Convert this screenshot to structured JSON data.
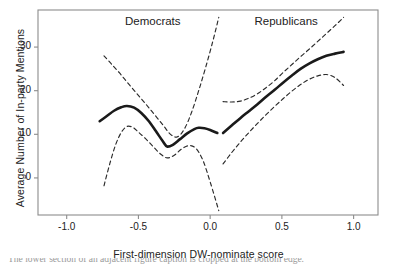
{
  "chart_data": {
    "type": "line",
    "title": "",
    "xlabel": "First-dimension DW-nominate score",
    "ylabel": "Average Number of In-party Mentions",
    "xlim": [
      -1.2,
      1.17
    ],
    "ylim": [
      -8.5,
      38.5
    ],
    "xticks": [
      -1.0,
      -0.5,
      0.0,
      0.5,
      1.0
    ],
    "xticklabels": [
      "-1.0",
      "-0.5",
      "0.0",
      "0.5",
      "1.0"
    ],
    "yticks": [
      0,
      10,
      20,
      30
    ],
    "yticklabels": [
      "0",
      "10",
      "20",
      "30"
    ],
    "grid": false,
    "legend": "none",
    "annotations": [
      {
        "text": "Democrats",
        "x": -0.4,
        "y": 35.5
      },
      {
        "text": "Republicans",
        "x": 0.53,
        "y": 35.5
      }
    ],
    "series": [
      {
        "name": "Democrats fit",
        "style": "solid",
        "color": "#1a1a1a",
        "x": [
          -0.77,
          -0.72,
          -0.67,
          -0.62,
          -0.58,
          -0.53,
          -0.48,
          -0.43,
          -0.38,
          -0.33,
          -0.3,
          -0.26,
          -0.21,
          -0.16,
          -0.11,
          -0.08,
          -0.04,
          0.0,
          0.05
        ],
        "y": [
          13.0,
          14.2,
          15.4,
          16.2,
          16.5,
          16.1,
          14.9,
          13.1,
          10.8,
          8.4,
          7.2,
          7.6,
          8.9,
          10.2,
          11.2,
          11.5,
          11.4,
          11.0,
          10.3
        ]
      },
      {
        "name": "Democrats upper CI",
        "style": "dashed",
        "color": "#2b2b2b",
        "x": [
          -0.74,
          -0.69,
          -0.63,
          -0.57,
          -0.51,
          -0.45,
          -0.39,
          -0.33,
          -0.28,
          -0.23,
          -0.18,
          -0.13,
          -0.08,
          -0.03,
          0.02,
          0.06
        ],
        "y": [
          28.0,
          26.2,
          24.0,
          21.6,
          19.3,
          17.0,
          14.6,
          12.2,
          10.1,
          9.4,
          11.2,
          15.0,
          20.0,
          25.5,
          31.5,
          36.8
        ]
      },
      {
        "name": "Democrats lower CI",
        "style": "dashed",
        "color": "#2b2b2b",
        "x": [
          -0.74,
          -0.7,
          -0.66,
          -0.62,
          -0.58,
          -0.54,
          -0.5,
          -0.45,
          -0.4,
          -0.35,
          -0.3,
          -0.25,
          -0.2,
          -0.15,
          -0.1,
          -0.05,
          0.0,
          0.06
        ],
        "y": [
          -1.8,
          3.2,
          7.5,
          10.4,
          11.8,
          11.6,
          10.5,
          9.0,
          7.3,
          5.6,
          4.6,
          5.2,
          6.6,
          7.4,
          6.8,
          4.0,
          -0.9,
          -7.5
        ]
      },
      {
        "name": "Republicans fit",
        "style": "solid",
        "color": "#1a1a1a",
        "x": [
          0.09,
          0.15,
          0.21,
          0.27,
          0.33,
          0.39,
          0.45,
          0.51,
          0.57,
          0.63,
          0.69,
          0.75,
          0.81,
          0.87,
          0.93
        ],
        "y": [
          10.3,
          12.0,
          13.7,
          15.3,
          16.9,
          18.6,
          20.2,
          21.9,
          23.5,
          25.0,
          26.2,
          27.2,
          28.0,
          28.5,
          28.9
        ]
      },
      {
        "name": "Republicans upper CI",
        "style": "dashed",
        "color": "#2b2b2b",
        "x": [
          0.09,
          0.15,
          0.21,
          0.27,
          0.33,
          0.39,
          0.45,
          0.51,
          0.57,
          0.63,
          0.69,
          0.75,
          0.81,
          0.87,
          0.93
        ],
        "y": [
          17.5,
          17.4,
          17.6,
          18.3,
          19.3,
          20.7,
          22.3,
          24.2,
          26.0,
          27.8,
          29.5,
          31.3,
          33.1,
          34.9,
          36.8
        ]
      },
      {
        "name": "Republicans lower CI",
        "style": "dashed",
        "color": "#2b2b2b",
        "x": [
          0.09,
          0.15,
          0.21,
          0.27,
          0.33,
          0.39,
          0.45,
          0.51,
          0.57,
          0.63,
          0.69,
          0.75,
          0.81,
          0.87,
          0.93
        ],
        "y": [
          3.2,
          5.8,
          8.2,
          10.4,
          12.5,
          14.5,
          16.4,
          18.2,
          19.9,
          21.4,
          22.6,
          23.4,
          23.7,
          23.0,
          21.2
        ]
      }
    ]
  },
  "axes": {
    "xlabel": "First-dimension DW-nominate score",
    "ylabel": "Average Number of In-party Mentions"
  },
  "labels": {
    "democrats": "Democrats",
    "republicans": "Republicans"
  },
  "caption": {
    "text": "The lower section of an adjacent figure caption is cropped at the bottom edge."
  },
  "colors": {
    "fit_line": "#1a1a1a",
    "ci_line": "#2b2b2b",
    "frame": "#8c8c8c",
    "text": "#222222",
    "background": "#ffffff"
  }
}
